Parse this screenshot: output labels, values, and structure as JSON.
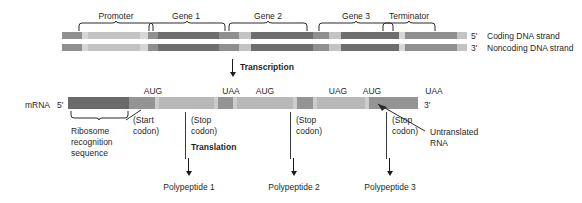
{
  "diagram": {
    "colors": {
      "dark_gray": "#6e6e6e",
      "mid_gray": "#8f8f8f",
      "light_gray": "#c3c3c3",
      "pale_gray": "#d6d6d6",
      "very_dark": "#5a5a5a",
      "mrna_dark": "#6a6a6a",
      "mrna_mid": "#949494",
      "mrna_light": "#b8b8b8",
      "mrna_pale": "#cccccc",
      "line": "#1a1a1a",
      "background": "#ffffff"
    },
    "dna": {
      "top_labels": [
        {
          "text": "Promoter",
          "x": 116
        },
        {
          "text": "Gene 1",
          "x": 186
        },
        {
          "text": "Gene 2",
          "x": 268
        },
        {
          "text": "Gene 3",
          "x": 356
        },
        {
          "text": "Terminator",
          "x": 409
        }
      ],
      "coding_strand_label": "Coding DNA strand",
      "noncoding_strand_label": "Noncoding DNA strand",
      "coding_end_label": "5'",
      "noncoding_end_label": "3'",
      "coding_segments": [
        {
          "width": 20,
          "shade": "mid_gray"
        },
        {
          "width": 6,
          "shade": "pale_gray"
        },
        {
          "width": 52,
          "shade": "light_gray"
        },
        {
          "width": 8,
          "shade": "pale_gray"
        },
        {
          "width": 10,
          "shade": "mid_gray"
        },
        {
          "width": 61,
          "shade": "dark_gray"
        },
        {
          "width": 20,
          "shade": "mid_gray"
        },
        {
          "width": 12,
          "shade": "light_gray"
        },
        {
          "width": 62,
          "shade": "dark_gray"
        },
        {
          "width": 16,
          "shade": "mid_gray"
        },
        {
          "width": 12,
          "shade": "light_gray"
        },
        {
          "width": 58,
          "shade": "dark_gray"
        },
        {
          "width": 6,
          "shade": "pale_gray"
        },
        {
          "width": 52,
          "shade": "mid_gray"
        },
        {
          "width": 10,
          "shade": "light_gray"
        }
      ],
      "noncoding_segments": [
        {
          "width": 20,
          "shade": "mid_gray"
        },
        {
          "width": 6,
          "shade": "pale_gray"
        },
        {
          "width": 52,
          "shade": "light_gray"
        },
        {
          "width": 8,
          "shade": "pale_gray"
        },
        {
          "width": 10,
          "shade": "mid_gray"
        },
        {
          "width": 61,
          "shade": "dark_gray"
        },
        {
          "width": 20,
          "shade": "mid_gray"
        },
        {
          "width": 12,
          "shade": "light_gray"
        },
        {
          "width": 62,
          "shade": "dark_gray"
        },
        {
          "width": 16,
          "shade": "mid_gray"
        },
        {
          "width": 12,
          "shade": "light_gray"
        },
        {
          "width": 58,
          "shade": "dark_gray"
        },
        {
          "width": 6,
          "shade": "pale_gray"
        },
        {
          "width": 52,
          "shade": "mid_gray"
        },
        {
          "width": 10,
          "shade": "light_gray"
        }
      ]
    },
    "transcription": {
      "label": "Transcription"
    },
    "mrna": {
      "name_label": "mRNA",
      "five_prime": "5'",
      "three_prime": "3'",
      "codons": [
        {
          "text": "AUG",
          "x": 153
        },
        {
          "text": "UAA",
          "x": 231
        },
        {
          "text": "AUG",
          "x": 265
        },
        {
          "text": "UAG",
          "x": 338
        },
        {
          "text": "AUG",
          "x": 372
        },
        {
          "text": "UAA",
          "x": 434
        }
      ],
      "segments": [
        {
          "width": 61,
          "shade": "mrna_dark"
        },
        {
          "width": 26,
          "shade": "mrna_mid"
        },
        {
          "width": 4,
          "shade": "mrna_pale"
        },
        {
          "width": 55,
          "shade": "mrna_light"
        },
        {
          "width": 4,
          "shade": "mrna_pale"
        },
        {
          "width": 15,
          "shade": "mrna_mid"
        },
        {
          "width": 4,
          "shade": "mrna_pale"
        },
        {
          "width": 56,
          "shade": "mrna_light"
        },
        {
          "width": 4,
          "shade": "mrna_pale"
        },
        {
          "width": 16,
          "shade": "mrna_mid"
        },
        {
          "width": 4,
          "shade": "mrna_pale"
        },
        {
          "width": 48,
          "shade": "mrna_light"
        },
        {
          "width": 4,
          "shade": "mrna_pale"
        },
        {
          "width": 49,
          "shade": "mrna_mid"
        }
      ]
    },
    "annotations": {
      "ribosome_line1": "Ribosome",
      "ribosome_line2": "recognition",
      "ribosome_line3": "sequence",
      "start_codon_line1": "(Start",
      "start_codon_line2": "codon)",
      "stop_codon_1_line1": "(Stop",
      "stop_codon_1_line2": "codon)",
      "stop_codon_2_line1": "(Stop",
      "stop_codon_2_line2": "codon)",
      "stop_codon_3_line1": "(Stop",
      "stop_codon_3_line2": "codon)",
      "untranslated_line1": "Untranslated",
      "untranslated_line2": "RNA",
      "translation_label": "Translation"
    },
    "products": [
      {
        "label": "Polypeptide 1",
        "x": 189
      },
      {
        "label": "Polypeptide 2",
        "x": 294
      },
      {
        "label": "Polypeptide 3",
        "x": 390
      }
    ]
  }
}
